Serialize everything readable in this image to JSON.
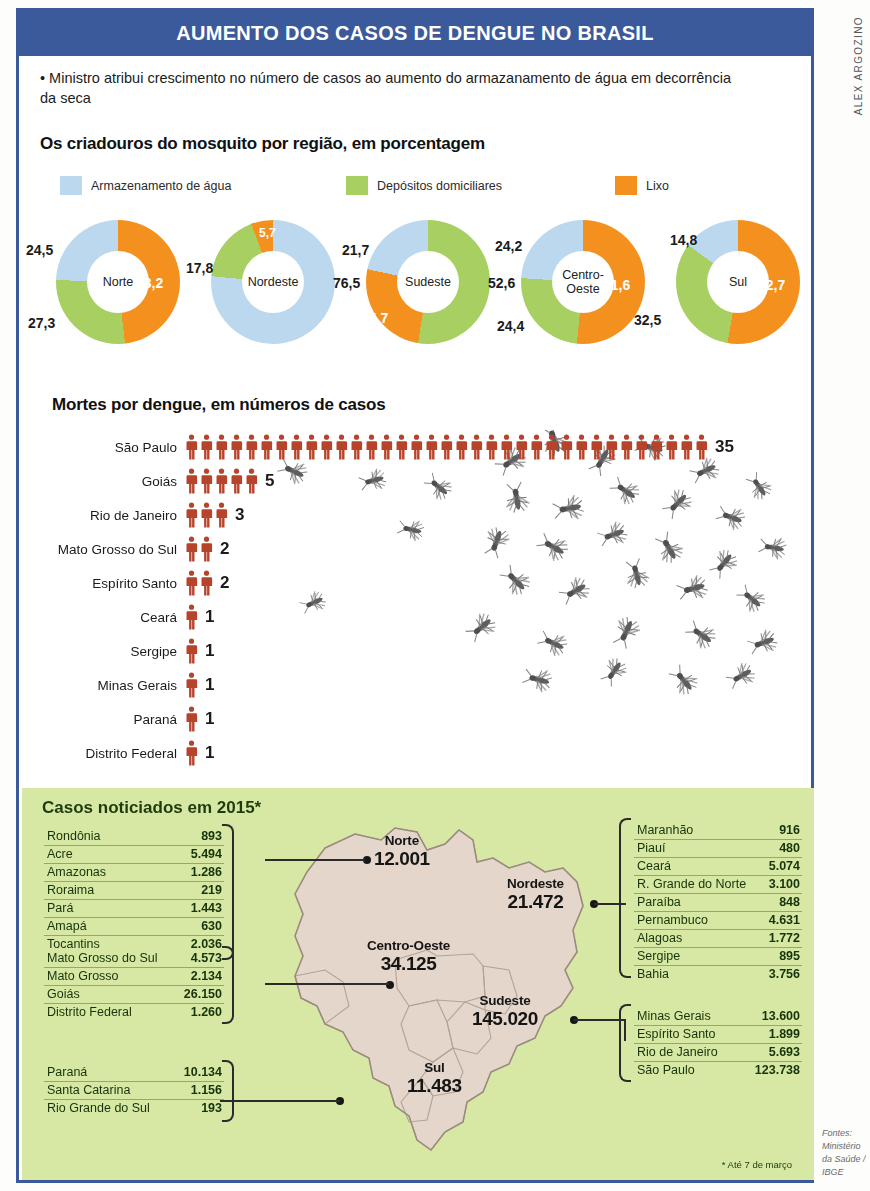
{
  "header": {
    "title": "AUMENTO DOS CASOS DE DENGUE NO BRASIL"
  },
  "credit": {
    "vertical": "ALEX ARGOZINO",
    "bottom": "Fontes: Ministério da Saúde / IBGE"
  },
  "lede": {
    "text": "• Ministro atribui crescimento no número de casos ao aumento do armazanamento de água em decorrência da seca"
  },
  "sections": {
    "donut_heading": "Os criadouros do mosquito por região, em porcentagem",
    "deaths_heading": "Mortes por dengue, em números de casos",
    "map_heading": "Casos noticiados em 2015*"
  },
  "legend": [
    {
      "label": "Armazenamento de água",
      "color": "#bcd8ee"
    },
    {
      "label": "Depósitos domiciliares",
      "color": "#a7cf62"
    },
    {
      "label": "Lixo",
      "color": "#f4911e"
    }
  ],
  "footnote": "* Até 7 de março",
  "chart_data": [
    {
      "type": "pie",
      "title": "Os criadouros do mosquito por região, em porcentagem",
      "legend_position": "top",
      "series_names": [
        "Armazenamento de água",
        "Depósitos domiciliares",
        "Lixo"
      ],
      "colors": [
        "#bcd8ee",
        "#a7cf62",
        "#f4911e"
      ],
      "categories": [
        "Norte",
        "Nordeste",
        "Sudeste",
        "Centro-Oeste",
        "Sul"
      ],
      "charts": [
        {
          "label": "Norte",
          "values": [
            24.5,
            27.3,
            48.2
          ],
          "labels": [
            "24,5",
            "27,3",
            "48,2"
          ]
        },
        {
          "label": "Nordeste",
          "values": [
            76.5,
            17.8,
            5.7
          ],
          "labels": [
            "76,5",
            "17,8",
            "5,7"
          ]
        },
        {
          "label": "Sudeste",
          "values": [
            21.7,
            52.6,
            25.7
          ],
          "labels": [
            "21,7",
            "52,6",
            "25,7"
          ]
        },
        {
          "label": "Centro-Oeste",
          "values": [
            24.2,
            24.4,
            51.6
          ],
          "labels": [
            "24,2",
            "24,4",
            "51,6"
          ]
        },
        {
          "label": "Sul",
          "values": [
            14.8,
            32.5,
            52.7
          ],
          "labels": [
            "14,8",
            "32,5",
            "52,7"
          ]
        }
      ]
    },
    {
      "type": "bar",
      "title": "Mortes por dengue, em números de casos",
      "xlabel": "",
      "ylabel": "",
      "unit": "mortes",
      "categories": [
        "São Paulo",
        "Goiás",
        "Rio de Janeiro",
        "Mato Grosso do Sul",
        "Espírito Santo",
        "Ceará",
        "Sergipe",
        "Minas Gerais",
        "Paraná",
        "Distrito Federal"
      ],
      "values": [
        35,
        5,
        3,
        2,
        2,
        1,
        1,
        1,
        1,
        1
      ],
      "value_labels": [
        "35",
        "5",
        "3",
        "2",
        "2",
        "1",
        "1",
        "1",
        "1",
        "1"
      ],
      "icon_color": "#b7442a"
    },
    {
      "type": "table",
      "title": "Casos noticiados em 2015*",
      "note": "* Até 7 de março",
      "regions": [
        {
          "name": "Norte",
          "total": "12.001",
          "total_value": 12001
        },
        {
          "name": "Nordeste",
          "total": "21.472",
          "total_value": 21472
        },
        {
          "name": "Centro-Oeste",
          "total": "34.125",
          "total_value": 34125
        },
        {
          "name": "Sudeste",
          "total": "145.020",
          "total_value": 145020
        },
        {
          "name": "Sul",
          "total": "11.483",
          "total_value": 11483
        }
      ],
      "states": [
        {
          "name": "Rondônia",
          "value": "893"
        },
        {
          "name": "Acre",
          "value": "5.494"
        },
        {
          "name": "Amazonas",
          "value": "1.286"
        },
        {
          "name": "Roraima",
          "value": "219"
        },
        {
          "name": "Pará",
          "value": "1.443"
        },
        {
          "name": "Amapá",
          "value": "630"
        },
        {
          "name": "Tocantins",
          "value": "2.036"
        },
        {
          "name": "Mato Grosso do Sul",
          "value": "4.573"
        },
        {
          "name": "Mato Grosso",
          "value": "2.134"
        },
        {
          "name": "Goiás",
          "value": "26.150"
        },
        {
          "name": "Distrito Federal",
          "value": "1.260"
        },
        {
          "name": "Paraná",
          "value": "10.134"
        },
        {
          "name": "Santa Catarina",
          "value": "1.156"
        },
        {
          "name": "Rio Grande do Sul",
          "value": "193"
        },
        {
          "name": "Maranhão",
          "value": "916"
        },
        {
          "name": "Piauí",
          "value": "480"
        },
        {
          "name": "Ceará",
          "value": "5.074"
        },
        {
          "name": "R. Grande do Norte",
          "value": "3.100"
        },
        {
          "name": "Paraíba",
          "value": "848"
        },
        {
          "name": "Pernambuco",
          "value": "4.631"
        },
        {
          "name": "Alagoas",
          "value": "1.772"
        },
        {
          "name": "Sergipe",
          "value": "895"
        },
        {
          "name": "Bahia",
          "value": "3.756"
        },
        {
          "name": "Minas Gerais",
          "value": "13.600"
        },
        {
          "name": "Espírito Santo",
          "value": "1.899"
        },
        {
          "name": "Rio de Janeiro",
          "value": "5.693"
        },
        {
          "name": "São Paulo",
          "value": "123.738"
        }
      ]
    }
  ],
  "donuts": [
    {
      "region": "Norte",
      "blue": "24,5",
      "green": "27,3",
      "orange": "48,2"
    },
    {
      "region": "Nordeste",
      "blue": "76,5",
      "green": "17,8",
      "orange": "5,7"
    },
    {
      "region": "Sudeste",
      "blue": "21,7",
      "green": "52,6",
      "orange": "25,7"
    },
    {
      "region": "Centro-Oeste",
      "blue": "24,2",
      "green": "24,4",
      "orange": "51,6"
    },
    {
      "region": "Sul",
      "blue": "14,8",
      "green": "32,5",
      "orange": "52,7"
    }
  ],
  "deaths": [
    {
      "state": "São Paulo",
      "count": "35"
    },
    {
      "state": "Goiás",
      "count": "5"
    },
    {
      "state": "Rio de Janeiro",
      "count": "3"
    },
    {
      "state": "Mato Grosso do Sul",
      "count": "2"
    },
    {
      "state": "Espírito Santo",
      "count": "2"
    },
    {
      "state": "Ceará",
      "count": "1"
    },
    {
      "state": "Sergipe",
      "count": "1"
    },
    {
      "state": "Minas Gerais",
      "count": "1"
    },
    {
      "state": "Paraná",
      "count": "1"
    },
    {
      "state": "Distrito Federal",
      "count": "1"
    }
  ],
  "map": {
    "regions": [
      {
        "name": "Norte",
        "value": "12.001"
      },
      {
        "name": "Nordeste",
        "value": "21.472"
      },
      {
        "name": "Centro-Oeste",
        "value": "34.125"
      },
      {
        "name": "Sudeste",
        "value": "145.020"
      },
      {
        "name": "Sul",
        "value": "11.483"
      }
    ]
  },
  "tables": {
    "norte": [
      {
        "name": "Rondônia",
        "value": "893"
      },
      {
        "name": "Acre",
        "value": "5.494"
      },
      {
        "name": "Amazonas",
        "value": "1.286"
      },
      {
        "name": "Roraima",
        "value": "219"
      },
      {
        "name": "Pará",
        "value": "1.443"
      },
      {
        "name": "Amapá",
        "value": "630"
      },
      {
        "name": "Tocantins",
        "value": "2.036"
      }
    ],
    "centro_oeste": [
      {
        "name": "Mato Grosso do Sul",
        "value": "4.573"
      },
      {
        "name": "Mato Grosso",
        "value": "2.134"
      },
      {
        "name": "Goiás",
        "value": "26.150"
      },
      {
        "name": "Distrito Federal",
        "value": "1.260"
      }
    ],
    "sul": [
      {
        "name": "Paraná",
        "value": "10.134"
      },
      {
        "name": "Santa Catarina",
        "value": "1.156"
      },
      {
        "name": "Rio Grande do Sul",
        "value": "193"
      }
    ],
    "nordeste": [
      {
        "name": "Maranhão",
        "value": "916"
      },
      {
        "name": "Piauí",
        "value": "480"
      },
      {
        "name": "Ceará",
        "value": "5.074"
      },
      {
        "name": "R. Grande do Norte",
        "value": "3.100"
      },
      {
        "name": "Paraíba",
        "value": "848"
      },
      {
        "name": "Pernambuco",
        "value": "4.631"
      },
      {
        "name": "Alagoas",
        "value": "1.772"
      },
      {
        "name": "Sergipe",
        "value": "895"
      },
      {
        "name": "Bahia",
        "value": "3.756"
      }
    ],
    "sudeste": [
      {
        "name": "Minas Gerais",
        "value": "13.600"
      },
      {
        "name": "Espírito Santo",
        "value": "1.899"
      },
      {
        "name": "Rio de Janeiro",
        "value": "5.693"
      },
      {
        "name": "São Paulo",
        "value": "123.738"
      }
    ]
  }
}
